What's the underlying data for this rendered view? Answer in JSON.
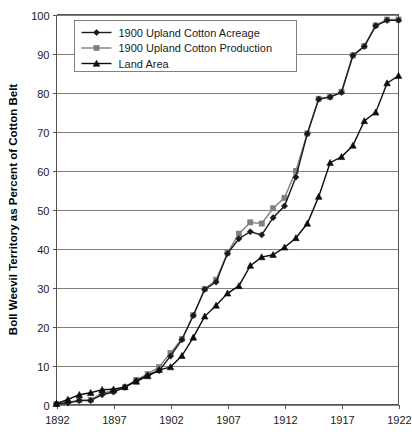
{
  "chart_data": {
    "type": "line",
    "title": "",
    "xlabel": "",
    "ylabel": "Boll Weevil Territory as Percent of Cotton Belt",
    "xlim": [
      1892,
      1922
    ],
    "ylim": [
      0,
      100
    ],
    "grid": true,
    "legend_position": "top-left-inside",
    "x_tick_labels": [
      "1892",
      "1897",
      "1902",
      "1907",
      "1912",
      "1917",
      "1922"
    ],
    "x_tick_values": [
      1892,
      1897,
      1902,
      1907,
      1912,
      1917,
      1922
    ],
    "y_tick_labels": [
      "0",
      "10",
      "20",
      "30",
      "40",
      "50",
      "60",
      "70",
      "80",
      "90",
      "100"
    ],
    "y_tick_values": [
      0,
      10,
      20,
      30,
      40,
      50,
      60,
      70,
      80,
      90,
      100
    ],
    "x": [
      1892,
      1893,
      1894,
      1895,
      1896,
      1897,
      1898,
      1899,
      1900,
      1901,
      1902,
      1903,
      1904,
      1905,
      1906,
      1907,
      1908,
      1909,
      1910,
      1911,
      1912,
      1913,
      1914,
      1915,
      1916,
      1917,
      1918,
      1919,
      1920,
      1921,
      1922
    ],
    "series": [
      {
        "name": "1900 Upland Cotton Acreage",
        "marker": "diamond",
        "color": "#1a1a1a",
        "values": [
          0.2,
          0.4,
          1.0,
          1.0,
          2.5,
          3.2,
          4.4,
          6.1,
          7.5,
          8.7,
          12.4,
          16.6,
          22.8,
          29.5,
          31.4,
          38.7,
          42.5,
          44.3,
          43.5,
          47.9,
          50.9,
          58.3,
          69.4,
          78.3,
          78.8,
          80.0,
          89.5,
          91.8,
          97.1,
          98.5,
          98.5
        ]
      },
      {
        "name": "1900 Upland Cotton Production",
        "marker": "square",
        "color": "#7f7f7f",
        "values": [
          0.1,
          0.5,
          1.1,
          1.2,
          2.9,
          3.5,
          4.5,
          6.3,
          7.8,
          9.6,
          13.2,
          16.8,
          22.9,
          29.6,
          32.0,
          38.9,
          43.8,
          46.7,
          46.4,
          50.3,
          53.0,
          59.9,
          69.5,
          78.4,
          78.9,
          80.2,
          89.5,
          91.9,
          97.2,
          98.7,
          98.7
        ]
      },
      {
        "name": "Land Area",
        "marker": "triangle",
        "color": "#0d0d0d",
        "values": [
          0.2,
          1.3,
          2.5,
          3.0,
          3.8,
          3.9,
          4.5,
          5.9,
          7.3,
          8.9,
          9.6,
          12.5,
          17.2,
          22.6,
          25.4,
          28.5,
          30.4,
          35.6,
          37.8,
          38.4,
          40.3,
          42.7,
          46.4,
          53.3,
          62.0,
          63.5,
          66.4,
          72.7,
          74.9,
          82.4,
          84.3
        ]
      }
    ]
  },
  "legend": {
    "entries": [
      {
        "label": "1900 Upland Cotton Acreage"
      },
      {
        "label": "1900 Upland Cotton Production"
      },
      {
        "label": "Land Area"
      }
    ]
  },
  "axes": {
    "y_axis_title": "Boll Weevil Territory as Percent of Cotton Belt"
  }
}
